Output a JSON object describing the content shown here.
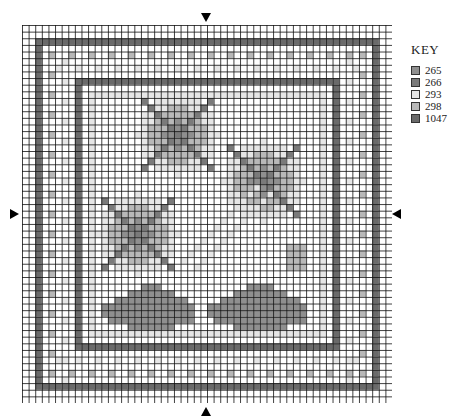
{
  "key": {
    "title": "KEY",
    "items": [
      {
        "code": "265",
        "color": "#8f8f8f"
      },
      {
        "code": "266",
        "color": "#7a7a7a"
      },
      {
        "code": "293",
        "color": "#e6e6e6"
      },
      {
        "code": "298",
        "color": "#b8b8b8"
      },
      {
        "code": "1047",
        "color": "#6a6a6a"
      }
    ]
  },
  "grid": {
    "cols": 56,
    "rows": 57,
    "cell": 6.6,
    "line_color": "#111111"
  },
  "center_markers": [
    "top",
    "bottom",
    "left",
    "right"
  ]
}
